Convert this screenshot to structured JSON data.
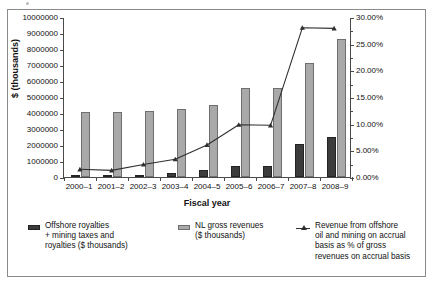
{
  "chart_data": {
    "type": "bar",
    "title": "",
    "xlabel": "Fiscal year",
    "ylabel": "$ (thousands)",
    "y2label": "",
    "categories": [
      "2000–1",
      "2001–2",
      "2002–3",
      "2003–4",
      "2004–5",
      "2005–6",
      "2006–7",
      "2007–8",
      "2008–9"
    ],
    "ylim": [
      0,
      10000000
    ],
    "y_ticks": [
      "0",
      "1000000",
      "2000000",
      "3000000",
      "4000000",
      "5000000",
      "6000000",
      "7000000",
      "8000000",
      "9000000",
      "10000000"
    ],
    "y_tick_values": [
      0,
      1000000,
      2000000,
      3000000,
      4000000,
      5000000,
      6000000,
      7000000,
      8000000,
      9000000,
      10000000
    ],
    "y2lim": [
      0,
      30
    ],
    "y2_ticks": [
      "0.00%",
      "5.00%",
      "10.00%",
      "15.00%",
      "20.00%",
      "25.00%",
      "30.00%"
    ],
    "y2_tick_values": [
      0,
      5,
      10,
      15,
      20,
      25,
      30
    ],
    "grid": false,
    "legend_position": "bottom",
    "series": [
      {
        "name": "Offshore royalties\n+ mining taxes and\nroyalties ($ thousands)",
        "type": "bar",
        "axis": "left",
        "color": "#3b3b3b",
        "values": [
          80000,
          70000,
          150000,
          230000,
          420000,
          700000,
          690000,
          2060000,
          2490000
        ]
      },
      {
        "name": "NL gross revenues\n($ thousands)",
        "type": "bar",
        "axis": "left",
        "color": "#a9a9a9",
        "values": [
          4050000,
          4060000,
          4110000,
          4220000,
          4510000,
          5580000,
          5550000,
          7150000,
          8650000
        ]
      },
      {
        "name": "Revenue from offshore\noil and mining on accrual\nbasis as % of gross\nrevenues on accrual basis",
        "type": "line",
        "axis": "right",
        "color": "#2f2f2f",
        "values": [
          1.45,
          1.25,
          2.35,
          3.35,
          6.05,
          9.85,
          9.75,
          28.15,
          28.05
        ]
      }
    ]
  },
  "legend": {
    "items": [
      {
        "marker": "dark-square",
        "label": "Offshore royalties\n+ mining taxes and\nroyalties ($ thousands)"
      },
      {
        "marker": "light-square",
        "label": "NL gross revenues\n($ thousands)"
      },
      {
        "marker": "line-triangle",
        "label": "Revenue from offshore\noil and mining on accrual\nbasis as % of gross\nrevenues on accrual basis"
      }
    ]
  },
  "colors": {
    "series_dark": "#3b3b3b",
    "series_light": "#a9a9a9",
    "line": "#2f2f2f",
    "axis": "#4a4a4a",
    "frame": "#8a8a8a",
    "background": "#ffffff"
  }
}
